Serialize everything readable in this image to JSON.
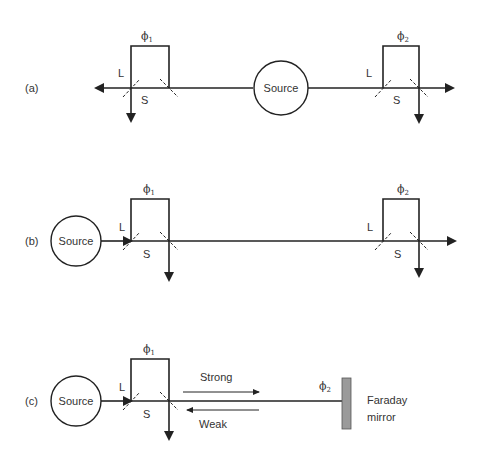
{
  "panels": {
    "a": {
      "label": "(a)",
      "source": "Source",
      "phi_left": "ϕ",
      "phi_left_sub": "1",
      "phi_right": "ϕ",
      "phi_right_sub": "2",
      "L_left": "L",
      "S_left": "S",
      "L_right": "L",
      "S_right": "S"
    },
    "b": {
      "label": "(b)",
      "source": "Source",
      "phi_left": "ϕ",
      "phi_left_sub": "1",
      "phi_right": "ϕ",
      "phi_right_sub": "2",
      "L_left": "L",
      "S_left": "S",
      "L_right": "L",
      "S_right": "S"
    },
    "c": {
      "label": "(c)",
      "source": "Source",
      "phi_left": "ϕ",
      "phi_left_sub": "1",
      "phi_right": "ϕ",
      "phi_right_sub": "2",
      "L_left": "L",
      "S_left": "S",
      "strong": "Strong",
      "weak": "Weak",
      "mirror_line1": "Faraday",
      "mirror_line2": "mirror"
    }
  },
  "colors": {
    "line": "#222222",
    "text": "#333333",
    "mirror": "#9a9a9a"
  }
}
